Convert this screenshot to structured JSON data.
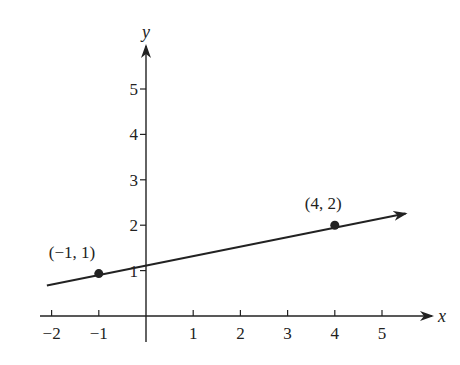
{
  "chart_data": {
    "type": "line",
    "title": "",
    "xlabel": "x",
    "ylabel": "y",
    "xlim": [
      -2.2,
      6.2
    ],
    "ylim": [
      -0.6,
      6
    ],
    "grid": false,
    "x_ticks": [
      -2,
      -1,
      1,
      2,
      3,
      4,
      5
    ],
    "y_ticks": [
      1,
      2,
      3,
      4,
      5
    ],
    "series": [
      {
        "name": "line through (-1, 1) and (4, 2)",
        "slope": 0.2,
        "intercept": 1.2,
        "x": [
          -2.1,
          5.5
        ],
        "y": [
          0.78,
          2.3
        ],
        "arrow_end": true
      }
    ],
    "points": [
      {
        "x": -1,
        "y": 1,
        "label": "(−1, 1)"
      },
      {
        "x": 4,
        "y": 2,
        "label": "(4, 2)"
      }
    ]
  },
  "colors": {
    "ink": "#222222",
    "background": "#ffffff"
  },
  "layout": {
    "origin_px": [
      146,
      316
    ],
    "unit_x_px": 47.2,
    "unit_y_px": 45.4
  }
}
